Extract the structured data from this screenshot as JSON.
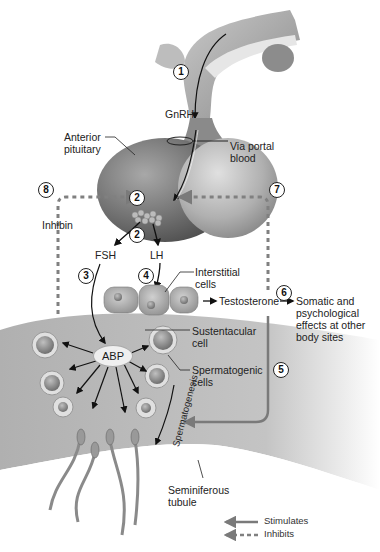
{
  "diagram": {
    "labels": {
      "gnrh": "GnRH",
      "anterior_pituitary": "Anterior pituitary",
      "via_portal_blood": "Via portal blood",
      "inhibin": "Inhibin",
      "fsh": "FSH",
      "lh": "LH",
      "interstitial_cells": "Interstitial cells",
      "testosterone": "Testosterone",
      "somatic_effects": "Somatic and psychological effects at other body sites",
      "sustentacular_cell": "Sustentacular cell",
      "spermatogenic_cells": "Spermatogenic cells",
      "abp": "ABP",
      "spermatogenesis": "Spermatogenesis",
      "seminiferous_tubule": "Seminiferous tubule"
    },
    "steps": [
      "1",
      "2",
      "2",
      "3",
      "4",
      "5",
      "6",
      "7",
      "8"
    ],
    "legend": {
      "stimulates": "Stimulates",
      "inhibits": "Inhibits"
    },
    "colors": {
      "arrow_stimulate": "#7a7a7a",
      "arrow_inhibit": "#808080",
      "pituitary_dark": "#6e6e6e",
      "pituitary_light": "#b8b8b8",
      "tubule": "#b5b5b5"
    }
  }
}
